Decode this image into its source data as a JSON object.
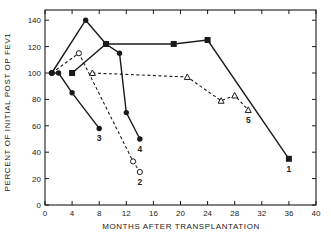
{
  "chart_data": {
    "type": "line",
    "title": "",
    "xlabel": "MONTHS AFTER TRANSPLANTATION",
    "ylabel": "PERCENT OF INITIAL POST OP FEV1",
    "xlim": [
      0,
      40
    ],
    "ylim": [
      0,
      150
    ],
    "xticks": [
      0,
      4,
      8,
      12,
      16,
      20,
      24,
      28,
      32,
      36,
      40
    ],
    "yticks": [
      0,
      20,
      40,
      60,
      80,
      100,
      120,
      140
    ],
    "grid": false,
    "legend": "none (series labeled by numbers at line ends)",
    "series": [
      {
        "name": "1",
        "marker": "filled-square",
        "line": "solid",
        "points": [
          [
            4,
            100
          ],
          [
            9,
            122
          ],
          [
            19,
            122
          ],
          [
            24,
            125
          ],
          [
            36,
            35
          ]
        ],
        "label_at": [
          36,
          35
        ]
      },
      {
        "name": "2",
        "marker": "open-circle",
        "line": "dashed",
        "points": [
          [
            1,
            100
          ],
          [
            5,
            115
          ],
          [
            13,
            33
          ],
          [
            14,
            25
          ]
        ],
        "label_at": [
          14,
          25
        ]
      },
      {
        "name": "3",
        "marker": "filled-circle",
        "line": "solid",
        "points": [
          [
            1,
            100
          ],
          [
            2,
            100
          ],
          [
            4,
            85
          ],
          [
            8,
            58
          ]
        ],
        "label_at": [
          8,
          58
        ]
      },
      {
        "name": "4",
        "marker": "filled-circle",
        "line": "solid",
        "points": [
          [
            1,
            100
          ],
          [
            6,
            140
          ],
          [
            9,
            122
          ],
          [
            11,
            115
          ],
          [
            12,
            70
          ],
          [
            14,
            50
          ]
        ],
        "label_at": [
          14,
          50
        ]
      },
      {
        "name": "5",
        "marker": "open-triangle",
        "line": "dashed",
        "points": [
          [
            7,
            100
          ],
          [
            21,
            97
          ],
          [
            26,
            79
          ],
          [
            28,
            83
          ],
          [
            30,
            72
          ]
        ],
        "label_at": [
          30,
          72
        ]
      }
    ]
  },
  "colors": {
    "ink": "#1a1a1a",
    "background": "#ffffff"
  }
}
